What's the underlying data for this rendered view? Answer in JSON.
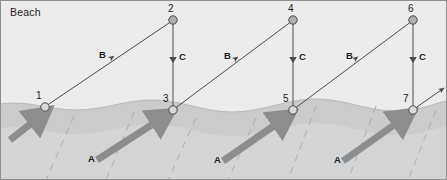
{
  "diagram": {
    "title_label": "Beach",
    "vector_labels": {
      "swash": "A",
      "longshore": "B",
      "backwash": "C"
    },
    "points": [
      {
        "id": "1",
        "label": "1",
        "x": 45,
        "y": 107,
        "kind": "shore-open"
      },
      {
        "id": "2",
        "label": "2",
        "x": 173,
        "y": 20,
        "kind": "beach-filled"
      },
      {
        "id": "3",
        "label": "3",
        "x": 173,
        "y": 110,
        "kind": "shore-open"
      },
      {
        "id": "4",
        "label": "4",
        "x": 293,
        "y": 20,
        "kind": "beach-filled"
      },
      {
        "id": "5",
        "label": "5",
        "x": 293,
        "y": 110,
        "kind": "shore-open"
      },
      {
        "id": "6",
        "label": "6",
        "x": 413,
        "y": 20,
        "kind": "beach-filled"
      },
      {
        "id": "7",
        "label": "7",
        "x": 413,
        "y": 110,
        "kind": "shore-open"
      }
    ],
    "swash_arrows": [
      {
        "label": "A",
        "label_x": 88,
        "label_y": 158
      },
      {
        "label": "A",
        "label_x": 214,
        "label_y": 158
      },
      {
        "label": "A",
        "label_x": 334,
        "label_y": 158
      }
    ],
    "longshore_arrows": [
      {
        "label": "B",
        "label_x": 99,
        "label_y": 54
      },
      {
        "label": "B",
        "label_x": 224,
        "label_y": 54
      },
      {
        "label": "B",
        "label_x": 346,
        "label_y": 54
      }
    ],
    "backwash_arrows": [
      {
        "label": "C",
        "label_x": 179,
        "label_y": 56
      },
      {
        "label": "C",
        "label_x": 299,
        "label_y": 56
      },
      {
        "label": "C",
        "label_x": 419,
        "label_y": 56
      }
    ],
    "colors": {
      "beach": "#ececed",
      "wet_sand": "#c9cacb",
      "water": "#d2d3d4",
      "swash_arrow": "#8c8d8f",
      "line": "#4a4a4c",
      "marker_fill": "#b4b5b7",
      "text": "#1b1b1b"
    }
  }
}
